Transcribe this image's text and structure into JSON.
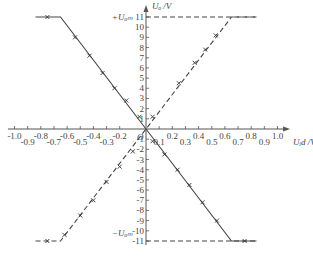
{
  "chart_data": {
    "type": "line",
    "title": "",
    "xlabel": "U_id /V",
    "ylabel": "U_o /V",
    "xlim": [
      -1.0,
      1.0
    ],
    "ylim": [
      -11,
      11
    ],
    "x_ticks": [
      -1.0,
      -0.9,
      -0.8,
      -0.7,
      -0.6,
      -0.5,
      -0.4,
      -0.3,
      -0.2,
      0.1,
      0.2,
      0.3,
      0.4,
      0.5,
      0.6,
      0.7,
      0.8,
      0.9,
      1.0
    ],
    "x_tick_labels": [
      "-1.0",
      "-0.9",
      "-0.8",
      "-0.7",
      "-0.6",
      "-0.5",
      "-0.4",
      "-0.3",
      "-0.2",
      "0.1",
      "0.2",
      "0.3",
      "0.4",
      "0.5",
      "0.6",
      "0.7",
      "0.8",
      "0.9",
      "1.0"
    ],
    "y_ticks": [
      -11,
      -10,
      -9,
      -8,
      -7,
      -6,
      -5,
      -4,
      -3,
      -2,
      -1,
      1,
      2,
      3,
      4,
      5,
      6,
      7,
      8,
      9,
      10,
      11
    ],
    "origin_label": "O",
    "annotations": [
      {
        "text": "+U_om",
        "at_y": 11
      },
      {
        "text": "-U_om",
        "at_y": -11
      }
    ],
    "grid": false,
    "legend": null,
    "series": [
      {
        "name": "inverting (solid)",
        "style": "solid",
        "points": [
          [
            -0.84,
            11
          ],
          [
            -0.65,
            11
          ],
          [
            0,
            0
          ],
          [
            0.65,
            -11
          ],
          [
            0.84,
            -11
          ]
        ],
        "markers": [
          [
            -0.75,
            11
          ],
          [
            -0.54,
            9
          ],
          [
            -0.43,
            7.2
          ],
          [
            -0.33,
            5.5
          ],
          [
            -0.24,
            4
          ],
          [
            -0.15,
            2.8
          ],
          [
            -0.05,
            1.2
          ],
          [
            0.05,
            -1.2
          ],
          [
            0.14,
            -2.5
          ],
          [
            0.24,
            -4
          ],
          [
            0.33,
            -5.5
          ],
          [
            0.43,
            -7.2
          ],
          [
            0.54,
            -9
          ],
          [
            0.75,
            -11
          ]
        ]
      },
      {
        "name": "non-inverting (dashed)",
        "style": "dashed",
        "points": [
          [
            -0.84,
            -11
          ],
          [
            -0.65,
            -11
          ],
          [
            0,
            0
          ],
          [
            0.65,
            11
          ],
          [
            0.84,
            11
          ]
        ],
        "markers": [
          [
            -0.75,
            -11
          ],
          [
            -0.62,
            -10.4
          ],
          [
            -0.5,
            -8.5
          ],
          [
            -0.4,
            -7
          ],
          [
            -0.3,
            -5.2
          ],
          [
            -0.2,
            -3.7
          ],
          [
            -0.1,
            -2.2
          ],
          [
            0.05,
            1.2
          ],
          [
            0.25,
            4.5
          ],
          [
            0.37,
            6.5
          ],
          [
            0.45,
            7.8
          ],
          [
            0.53,
            9.2
          ]
        ]
      },
      {
        "name": "+U_om reference",
        "style": "dashed",
        "points": [
          [
            0,
            11
          ],
          [
            0.84,
            11
          ]
        ]
      },
      {
        "name": "-U_om reference",
        "style": "dashed",
        "points": [
          [
            0,
            -11
          ],
          [
            0.84,
            -11
          ]
        ]
      }
    ]
  }
}
